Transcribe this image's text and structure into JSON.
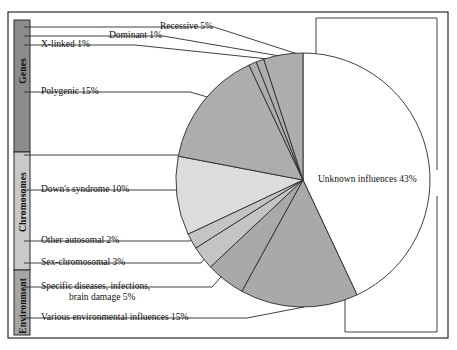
{
  "figure": {
    "background_color": "#ffffff",
    "outline_color": "#2b2b2b"
  },
  "categories": [
    {
      "name": "genes",
      "label": "Genes",
      "color": "#8c8c8c",
      "y_top": 20,
      "y_bottom": 152
    },
    {
      "name": "chromosomes",
      "label": "Chromosomes",
      "color": "#c9c9c9",
      "y_top": 152,
      "y_bottom": 270
    },
    {
      "name": "environment",
      "label": "Environment",
      "color": "#a6a6a6",
      "y_top": 270,
      "y_bottom": 335
    }
  ],
  "labels": {
    "recessive": "Recessive 5%",
    "dominant": "Dominant 1%",
    "xlinked": "X-linked 1%",
    "polygenic": "Polygenic 15%",
    "downs": "Down's syndrome 10%",
    "other_autosomal": "Other autosomal 2%",
    "sex_chromosomal": "Sex-chromosomal 3%",
    "specific_line1": "Specific diseases, infections,",
    "specific_line2": "brain damage  5%",
    "various_env": "Various environmental  influences  15%",
    "unknown": "Unknown influences 43%"
  },
  "chart_data": {
    "type": "pie",
    "center": {
      "x": 303,
      "y": 180
    },
    "radius": 127,
    "start_angle_deg": 0,
    "direction": "clockwise",
    "total": 100,
    "units": "percent",
    "legend": "callout-labels",
    "grid": false,
    "categories": [
      "Unknown influences",
      "Various environmental  influences",
      "Specific diseases, infections, brain damage",
      "Sex-chromosomal",
      "Other autosomal",
      "Down's syndrome",
      "Polygenic",
      "X-linked",
      "Dominant",
      "Recessive"
    ],
    "values": [
      43,
      15,
      5,
      3,
      2,
      10,
      15,
      1,
      1,
      5
    ],
    "slices": [
      {
        "key": "unknown",
        "label": "Unknown influences 43%",
        "value": 43,
        "color": "#ffffff",
        "group": "unknown"
      },
      {
        "key": "various_env",
        "label": "Various environmental  influences  15%",
        "value": 15,
        "color": "#a9a9a9",
        "group": "environment"
      },
      {
        "key": "specific",
        "label": "Specific diseases, infections, brain damage  5%",
        "value": 5,
        "color": "#a9a9a9",
        "group": "environment"
      },
      {
        "key": "sex_chrom",
        "label": "Sex-chromosomal 3%",
        "value": 3,
        "color": "#c4c4c4",
        "group": "chromosomes"
      },
      {
        "key": "other_auto",
        "label": "Other autosomal 2%",
        "value": 2,
        "color": "#c4c4c4",
        "group": "chromosomes"
      },
      {
        "key": "downs",
        "label": "Down's syndrome 10%",
        "value": 10,
        "color": "#dcdcdc",
        "group": "chromosomes"
      },
      {
        "key": "polygenic",
        "label": "Polygenic 15%",
        "value": 15,
        "color": "#adadad",
        "group": "genes"
      },
      {
        "key": "xlinked",
        "label": "X-linked 1%",
        "value": 1,
        "color": "#adadad",
        "group": "genes"
      },
      {
        "key": "dominant",
        "label": "Dominant 1%",
        "value": 1,
        "color": "#adadad",
        "group": "genes"
      },
      {
        "key": "recessive",
        "label": "Recessive 5%",
        "value": 5,
        "color": "#adadad",
        "group": "genes"
      }
    ]
  }
}
